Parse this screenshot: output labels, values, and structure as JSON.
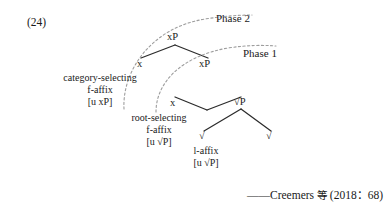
{
  "example": {
    "number": "(24)"
  },
  "phases": {
    "phase2_label": "Phase 2",
    "phase1_label": "Phase 1"
  },
  "tree": {
    "nodes": {
      "root_xp": "xP",
      "spec_x": "x",
      "inner_xp": "xP",
      "inner_x": "x",
      "root_p": "√P",
      "left_root": "√",
      "right_root": "√"
    },
    "glosses": {
      "category_selecting": {
        "line1": "category-selecting",
        "line2": "f-affix",
        "line3": "[u xP]"
      },
      "root_selecting": {
        "line1": "root-selecting",
        "line2": "f-affix",
        "line3": "[u √P]"
      },
      "l_affix": {
        "line1": "l-affix",
        "line2": "[u √P]"
      }
    }
  },
  "citation": {
    "dash": "——",
    "author": "Creemers ",
    "etal": "等",
    "ref": " (2018：68)"
  },
  "colors": {
    "ink": "#1a1a1a",
    "line": "#2b2b2b",
    "dashed": "#9a9a9a",
    "background": "#ffffff"
  }
}
